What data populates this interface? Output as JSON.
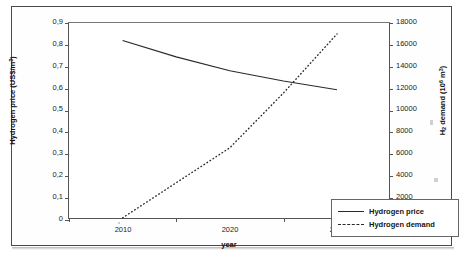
{
  "chart_data": {
    "type": "line",
    "title": "",
    "xlabel": "year",
    "grid": false,
    "legend_position": "inside-lower-right",
    "x": [
      2010,
      2015,
      2020,
      2025,
      2030
    ],
    "categories": [
      "2010",
      "2020",
      "2030"
    ],
    "x_tick_labels": [
      "2010",
      "2020",
      "2030"
    ],
    "axes": {
      "left": {
        "label": "Hydrogen price (US$/m",
        "label_sup": "3",
        "label_suffix": ")",
        "ylim": [
          0,
          0.9
        ],
        "tick_step": 0.1,
        "tick_labels": [
          "0,9",
          "0,8",
          "0,7",
          "0,6",
          "0,5",
          "0,4",
          "0,3",
          "0,2",
          "0,1",
          "0"
        ],
        "decimal_separator": ","
      },
      "right": {
        "label_prefix": "H",
        "label_sub": "2",
        "label_mid": " demand (10",
        "label_sup": "6",
        "label_suffix": " m",
        "label_sup2": "3",
        "label_end": ")",
        "ylim": [
          0,
          18000
        ],
        "tick_step": 2000,
        "tick_labels": [
          "18000",
          "16000",
          "14000",
          "12000",
          "10000",
          "8000",
          "6000",
          "4000",
          "2000",
          "0"
        ]
      }
    },
    "series": [
      {
        "name": "Hydrogen price",
        "axis": "left",
        "style": "solid",
        "color": "#2a2a2a",
        "x": [
          2010,
          2015,
          2020,
          2025,
          2030
        ],
        "values": [
          0.82,
          0.745,
          0.682,
          0.635,
          0.595
        ]
      },
      {
        "name": "Hydrogen demand",
        "axis": "right",
        "style": "dotted",
        "color": "#2a2a2a",
        "x": [
          2010,
          2015,
          2020,
          2025,
          2030
        ],
        "values": [
          200,
          3400,
          6600,
          11600,
          17000
        ]
      }
    ],
    "annotations": []
  },
  "legend": {
    "items": [
      {
        "label": "Hydrogen price",
        "style": "solid"
      },
      {
        "label": "Hydrogen demand",
        "style": "dotted"
      }
    ]
  },
  "axis_titles": {
    "x": "year",
    "left": "Hydrogen price (US$/m³)",
    "right": "H₂ demand (10⁶ m³)"
  }
}
